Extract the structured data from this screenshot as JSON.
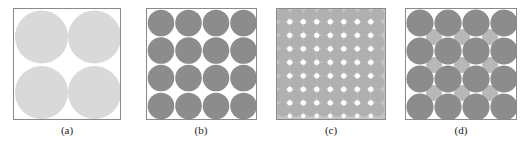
{
  "figure": {
    "panels": [
      {
        "id": "a",
        "caption": "(a)",
        "description": "2x2 square packing of large circles",
        "grid": 2,
        "circle_color": "#d9d9d9",
        "interstitial": "none"
      },
      {
        "id": "b",
        "caption": "(b)",
        "description": "4x4 square packing of circles",
        "grid": 4,
        "circle_color": "#8c8c8c",
        "interstitial": "none"
      },
      {
        "id": "c",
        "caption": "(c)",
        "description": "dense square packing of small circles",
        "grid": 8,
        "circle_color": "#b4b4b4",
        "interstitial": "none"
      },
      {
        "id": "d",
        "caption": "(d)",
        "description": "4x4 square packing with smaller circles filling interstices",
        "grid": 4,
        "circle_color": "#8c8c8c",
        "interstitial_color": "#b8b8b8",
        "interstitial": "small-circles"
      }
    ],
    "colors": {
      "frame_border": "#8a8a8a",
      "background": "#ffffff",
      "caption_text": "#222222"
    }
  }
}
